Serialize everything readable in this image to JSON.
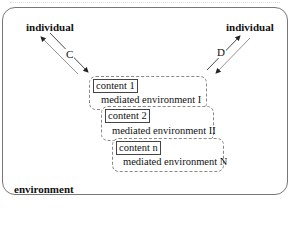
{
  "diagram": {
    "outer_label": "environment",
    "individual_left": "individual",
    "individual_right": "individual",
    "arrow_left_label": "C",
    "arrow_right_label": "D",
    "mediated_boxes": [
      {
        "content": "content 1",
        "environment": "mediated environment I"
      },
      {
        "content": "content 2",
        "environment": "mediated environment II"
      },
      {
        "content": "content n",
        "environment": "mediated environment N"
      }
    ]
  }
}
